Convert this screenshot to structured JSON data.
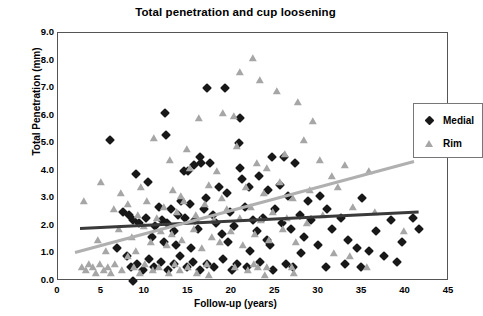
{
  "chart_data": {
    "type": "scatter",
    "title": "Total penetration and cup loosening",
    "xlabel": "Follow-up (years)",
    "ylabel": "Total Penetration (mm)",
    "xlim": [
      0,
      45
    ],
    "ylim": [
      0,
      9
    ],
    "xticks": [
      "0",
      "5",
      "10",
      "15",
      "20",
      "25",
      "30",
      "35",
      "40",
      "45"
    ],
    "yticks": [
      "0.0",
      "1.0",
      "2.0",
      "3.0",
      "4.0",
      "5.0",
      "6.0",
      "7.0",
      "8.0",
      "9.0"
    ],
    "grid": false,
    "legend_position": "top-right",
    "colors": {
      "medial": "#181818",
      "rim": "#a6a6a6",
      "trend_medial": "#3a3a3a",
      "trend_rim": "#b0b0b0",
      "axis": "#555555"
    },
    "series": [
      {
        "name": "Medial",
        "marker": "diamond",
        "color": "#181818",
        "trendline": {
          "x0": 2.5,
          "y0": 1.95,
          "x1": 41.5,
          "y1": 2.55,
          "color": "#3a3a3a"
        },
        "points": [
          [
            6.0,
            5.1
          ],
          [
            12.3,
            6.1
          ],
          [
            17.2,
            7.0
          ],
          [
            19.2,
            7.0
          ],
          [
            21.0,
            5.9
          ],
          [
            20.8,
            5.0
          ],
          [
            24.6,
            4.5
          ],
          [
            20.9,
            4.1
          ],
          [
            21.2,
            3.7
          ],
          [
            22.0,
            3.4
          ],
          [
            12.4,
            5.3
          ],
          [
            16.3,
            4.5
          ],
          [
            26.0,
            4.5
          ],
          [
            27.3,
            4.3
          ],
          [
            25.5,
            3.5
          ],
          [
            9.0,
            3.9
          ],
          [
            10.4,
            3.6
          ],
          [
            14.5,
            4.0
          ],
          [
            15.6,
            4.2
          ],
          [
            15.0,
            4.0
          ],
          [
            16.5,
            4.3
          ],
          [
            17.5,
            4.3
          ],
          [
            18.5,
            3.4
          ],
          [
            19.4,
            3.2
          ],
          [
            23.1,
            3.8
          ],
          [
            24.2,
            3.3
          ],
          [
            26.5,
            3.1
          ],
          [
            28.8,
            2.9
          ],
          [
            30.2,
            3.1
          ],
          [
            31.0,
            2.6
          ],
          [
            35.0,
            3.0
          ],
          [
            38.3,
            2.2
          ],
          [
            39.6,
            1.4
          ],
          [
            40.8,
            2.3
          ],
          [
            41.5,
            1.9
          ],
          [
            7.5,
            2.5
          ],
          [
            8.2,
            2.4
          ],
          [
            8.6,
            2.2
          ],
          [
            9.3,
            2.1
          ],
          [
            10.1,
            2.3
          ],
          [
            10.8,
            1.6
          ],
          [
            11.2,
            2.0
          ],
          [
            11.6,
            2.7
          ],
          [
            12.0,
            2.2
          ],
          [
            12.6,
            2.1
          ],
          [
            13.0,
            2.6
          ],
          [
            13.4,
            1.8
          ],
          [
            13.8,
            2.4
          ],
          [
            14.2,
            2.9
          ],
          [
            14.6,
            2.3
          ],
          [
            15.2,
            2.8
          ],
          [
            15.8,
            2.2
          ],
          [
            16.1,
            1.9
          ],
          [
            16.8,
            2.6
          ],
          [
            17.0,
            3.0
          ],
          [
            17.8,
            2.4
          ],
          [
            18.2,
            2.1
          ],
          [
            18.9,
            1.7
          ],
          [
            19.8,
            2.5
          ],
          [
            20.3,
            2.0
          ],
          [
            21.5,
            2.7
          ],
          [
            22.4,
            2.2
          ],
          [
            22.9,
            1.8
          ],
          [
            23.6,
            2.3
          ],
          [
            24.0,
            1.5
          ],
          [
            25.0,
            2.6
          ],
          [
            25.8,
            2.1
          ],
          [
            26.8,
            1.9
          ],
          [
            27.8,
            2.4
          ],
          [
            28.3,
            1.6
          ],
          [
            29.1,
            2.2
          ],
          [
            29.9,
            1.3
          ],
          [
            31.5,
            1.9
          ],
          [
            32.6,
            2.3
          ],
          [
            33.4,
            1.5
          ],
          [
            34.4,
            1.2
          ],
          [
            35.8,
            1.1
          ],
          [
            36.6,
            1.8
          ],
          [
            37.5,
            0.9
          ],
          [
            39.0,
            0.7
          ],
          [
            6.8,
            1.2
          ],
          [
            7.9,
            0.9
          ],
          [
            8.4,
            0.5
          ],
          [
            8.6,
            0.0
          ],
          [
            9.1,
            0.6
          ],
          [
            9.8,
            0.4
          ],
          [
            10.5,
            0.8
          ],
          [
            11.1,
            0.5
          ],
          [
            11.9,
            0.7
          ],
          [
            12.7,
            0.4
          ],
          [
            13.3,
            0.6
          ],
          [
            14.0,
            0.9
          ],
          [
            14.9,
            0.5
          ],
          [
            15.5,
            0.7
          ],
          [
            16.4,
            0.4
          ],
          [
            17.1,
            0.6
          ],
          [
            18.0,
            0.5
          ],
          [
            19.0,
            0.8
          ],
          [
            20.0,
            0.4
          ],
          [
            20.6,
            0.6
          ],
          [
            21.7,
            0.5
          ],
          [
            23.3,
            0.7
          ],
          [
            24.8,
            0.4
          ],
          [
            26.2,
            0.6
          ],
          [
            27.0,
            0.5
          ],
          [
            30.9,
            0.5
          ],
          [
            12.2,
            1.4
          ],
          [
            13.6,
            1.3
          ],
          [
            15.3,
            1.2
          ],
          [
            19.6,
            1.4
          ],
          [
            22.1,
            1.1
          ],
          [
            24.4,
            1.3
          ],
          [
            28.0,
            1.0
          ],
          [
            33.0,
            0.6
          ],
          [
            34.9,
            0.5
          ]
        ]
      },
      {
        "name": "Rim",
        "marker": "triangle",
        "color": "#a6a6a6",
        "trendline": {
          "x0": 2.0,
          "y0": 1.1,
          "x1": 41.0,
          "y1": 4.4,
          "color": "#b0b0b0"
        },
        "points": [
          [
            22.4,
            8.1
          ],
          [
            21.0,
            7.6
          ],
          [
            23.2,
            7.3
          ],
          [
            25.2,
            6.9
          ],
          [
            27.6,
            6.5
          ],
          [
            19.0,
            6.1
          ],
          [
            16.2,
            5.9
          ],
          [
            20.2,
            6.0
          ],
          [
            29.4,
            5.8
          ],
          [
            28.3,
            5.1
          ],
          [
            11.0,
            5.2
          ],
          [
            14.8,
            4.8
          ],
          [
            12.9,
            4.4
          ],
          [
            15.2,
            4.1
          ],
          [
            20.6,
            4.9
          ],
          [
            18.3,
            4.0
          ],
          [
            22.9,
            4.3
          ],
          [
            24.0,
            4.1
          ],
          [
            26.1,
            4.6
          ],
          [
            30.1,
            4.4
          ],
          [
            31.5,
            3.8
          ],
          [
            33.0,
            4.2
          ],
          [
            35.8,
            4.0
          ],
          [
            5.0,
            3.6
          ],
          [
            7.2,
            3.2
          ],
          [
            9.6,
            3.4
          ],
          [
            13.2,
            3.3
          ],
          [
            14.1,
            3.1
          ],
          [
            17.4,
            3.5
          ],
          [
            18.9,
            3.0
          ],
          [
            21.6,
            3.4
          ],
          [
            23.7,
            3.2
          ],
          [
            25.6,
            3.6
          ],
          [
            27.0,
            3.0
          ],
          [
            29.0,
            3.3
          ],
          [
            32.2,
            3.4
          ],
          [
            34.0,
            2.7
          ],
          [
            36.5,
            2.5
          ],
          [
            39.8,
            1.8
          ],
          [
            6.4,
            2.6
          ],
          [
            8.1,
            2.8
          ],
          [
            9.2,
            2.4
          ],
          [
            10.2,
            2.9
          ],
          [
            11.4,
            2.3
          ],
          [
            12.2,
            2.7
          ],
          [
            13.7,
            2.5
          ],
          [
            14.5,
            2.9
          ],
          [
            15.9,
            2.4
          ],
          [
            16.9,
            2.8
          ],
          [
            17.9,
            2.2
          ],
          [
            19.5,
            2.6
          ],
          [
            20.9,
            2.3
          ],
          [
            22.2,
            2.7
          ],
          [
            23.4,
            2.2
          ],
          [
            24.7,
            2.5
          ],
          [
            26.4,
            2.3
          ],
          [
            28.7,
            2.1
          ],
          [
            30.5,
            2.4
          ],
          [
            7.0,
            1.9
          ],
          [
            8.5,
            1.6
          ],
          [
            9.9,
            2.0
          ],
          [
            10.7,
            1.4
          ],
          [
            11.8,
            1.8
          ],
          [
            12.5,
            1.3
          ],
          [
            13.1,
            1.7
          ],
          [
            14.3,
            1.5
          ],
          [
            15.7,
            1.9
          ],
          [
            16.6,
            1.2
          ],
          [
            17.7,
            1.6
          ],
          [
            18.6,
            1.4
          ],
          [
            19.9,
            1.8
          ],
          [
            21.3,
            1.3
          ],
          [
            22.7,
            1.7
          ],
          [
            24.3,
            1.5
          ],
          [
            25.9,
            1.9
          ],
          [
            27.4,
            1.4
          ],
          [
            2.8,
            0.5
          ],
          [
            3.2,
            0.4
          ],
          [
            3.6,
            0.6
          ],
          [
            4.0,
            0.5
          ],
          [
            4.4,
            0.3
          ],
          [
            4.8,
            0.6
          ],
          [
            5.3,
            0.4
          ],
          [
            5.7,
            0.5
          ],
          [
            6.1,
            0.3
          ],
          [
            6.6,
            0.6
          ],
          [
            7.4,
            0.4
          ],
          [
            8.8,
            0.5
          ],
          [
            9.4,
            0.3
          ],
          [
            10.0,
            0.6
          ],
          [
            10.9,
            0.4
          ],
          [
            11.6,
            0.5
          ],
          [
            12.8,
            0.3
          ],
          [
            13.5,
            0.6
          ],
          [
            14.0,
            0.4
          ],
          [
            15.0,
            0.5
          ],
          [
            16.0,
            0.3
          ],
          [
            17.2,
            0.6
          ],
          [
            17.4,
            0.2
          ],
          [
            20.4,
            0.5
          ],
          [
            21.9,
            0.4
          ],
          [
            22.6,
            0.6
          ],
          [
            23.0,
            0.5
          ],
          [
            23.8,
            0.2
          ],
          [
            24.1,
            0.5
          ],
          [
            26.9,
            0.5
          ],
          [
            27.2,
            0.3
          ],
          [
            35.6,
            0.5
          ],
          [
            31.8,
            1.0
          ],
          [
            33.6,
            0.9
          ],
          [
            3.0,
            2.9
          ],
          [
            4.6,
            1.5
          ],
          [
            5.5,
            1.1
          ],
          [
            8.0,
            0.9
          ],
          [
            9.0,
            1.1
          ]
        ]
      }
    ]
  },
  "legend": {
    "medial_label": "Medial",
    "rim_label": "Rim"
  }
}
